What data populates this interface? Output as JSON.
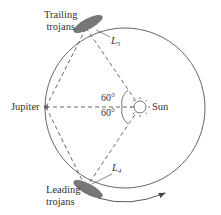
{
  "labels": {
    "trailing_line1": "Trailing",
    "trailing_line2": "trojans",
    "leading_line1": "Leading",
    "leading_line2": "trojans",
    "jupiter": "Jupiter",
    "sun": "Sun",
    "l5_main": "L",
    "l5_sub": "5",
    "l4_main": "L",
    "l4_sub": "4",
    "angle_top": "60°",
    "angle_bottom": "60°"
  },
  "colors": {
    "line": "#555555",
    "text": "#333333"
  }
}
